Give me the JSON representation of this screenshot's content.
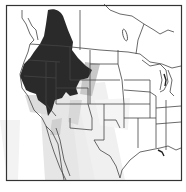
{
  "map": {
    "type": "species-range-map",
    "region": "Western North America / United States",
    "colors": {
      "background": "#ffffff",
      "frame": "#333333",
      "borders": "#444444",
      "breeding_range": "#2a2a2a",
      "migration_range": "#d4d4d4",
      "migration_light": "#ececec"
    },
    "legend": []
  }
}
